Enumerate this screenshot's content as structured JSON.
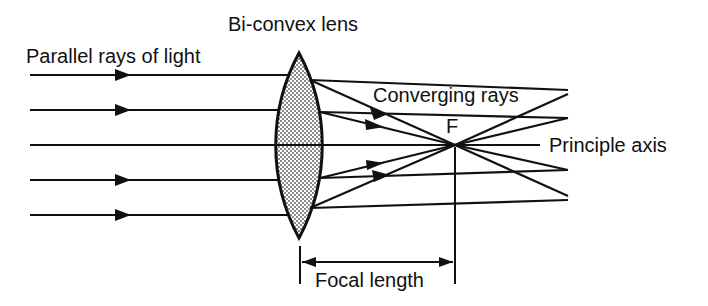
{
  "labels": {
    "lens": "Bi-convex lens",
    "parallel_rays": "Parallel rays of light",
    "converging_rays": "Converging rays",
    "focus": "F",
    "principal_axis": "Principle axis",
    "focal_length": "Focal length"
  },
  "colors": {
    "line": "#111111",
    "background": "#ffffff",
    "lens_fill": "#e6e6e6"
  },
  "geometry": {
    "incident_ray_y": [
      75,
      110,
      145,
      180,
      215
    ],
    "focus_point": [
      455,
      145
    ],
    "lens_center_x": 299,
    "lens_top_y": 53,
    "lens_bottom_y": 238,
    "focal_length_line_y": 262
  }
}
